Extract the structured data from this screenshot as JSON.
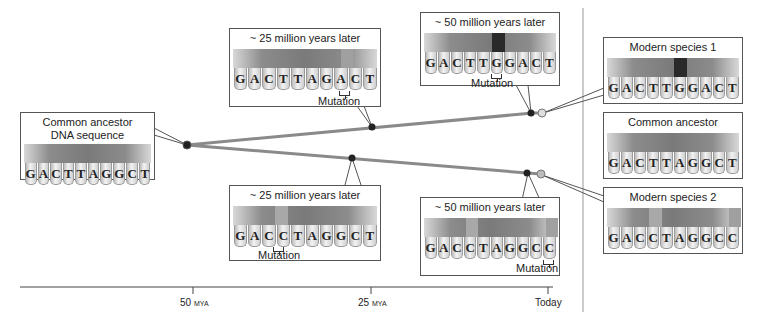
{
  "colors": {
    "branch": "#8a8a8a",
    "node_dark": "#222222",
    "node_light": "#cfcfcf",
    "mutation_dark": "#2a2a2a",
    "mutation_light": "#a0a0a0"
  },
  "ancestor": {
    "title_line1": "Common ancestor",
    "title_line2": "DNA sequence",
    "bases": [
      "G",
      "A",
      "C",
      "T",
      "T",
      "A",
      "G",
      "G",
      "C",
      "T"
    ]
  },
  "branch1": {
    "stage1": {
      "title": "~ 25 million years later",
      "bases": [
        "G",
        "A",
        "C",
        "T",
        "T",
        "A",
        "G",
        "A",
        "C",
        "T"
      ],
      "mutation_label": "Mutation",
      "mutation_index": 7
    },
    "stage2": {
      "title": "~ 50 million years later",
      "bases": [
        "G",
        "A",
        "C",
        "T",
        "T",
        "G",
        "G",
        "A",
        "C",
        "T"
      ],
      "mutation_label": "Mutation",
      "mutation_index": 5
    }
  },
  "branch2": {
    "stage1": {
      "title": "~ 25 million years later",
      "bases": [
        "G",
        "A",
        "C",
        "C",
        "T",
        "A",
        "G",
        "G",
        "C",
        "T"
      ],
      "mutation_label": "Mutation",
      "mutation_index": 3
    },
    "stage2": {
      "title": "~ 50 million years later",
      "bases": [
        "G",
        "A",
        "C",
        "C",
        "T",
        "A",
        "G",
        "G",
        "C",
        "C"
      ],
      "mutation_label": "Mutation",
      "mutation_index": 9
    }
  },
  "comparison": {
    "species1": {
      "title": "Modern species 1",
      "bases": [
        "G",
        "A",
        "C",
        "T",
        "T",
        "G",
        "G",
        "A",
        "C",
        "T"
      ]
    },
    "ancestor": {
      "title": "Common ancestor",
      "bases": [
        "G",
        "A",
        "C",
        "T",
        "T",
        "A",
        "G",
        "G",
        "C",
        "T"
      ]
    },
    "species2": {
      "title": "Modern species 2",
      "bases": [
        "G",
        "A",
        "C",
        "C",
        "T",
        "A",
        "G",
        "G",
        "C",
        "C"
      ]
    }
  },
  "axis": {
    "ticks": [
      {
        "value": "50",
        "unit": "MYA"
      },
      {
        "value": "25",
        "unit": "MYA"
      },
      {
        "value": "Today",
        "unit": ""
      }
    ]
  }
}
